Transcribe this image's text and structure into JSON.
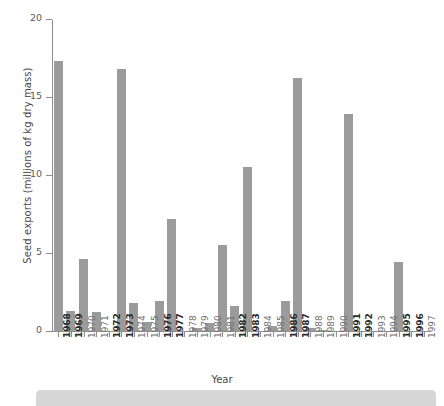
{
  "chart_data": {
    "type": "bar",
    "title": "",
    "xlabel": "Year",
    "ylabel": "Seed exports (millions of kg dry mass)",
    "ylim": [
      0,
      20
    ],
    "yticks": [
      0,
      5,
      10,
      15,
      20
    ],
    "ytick_labels": [
      "0",
      "5",
      "10",
      "15",
      "20"
    ],
    "grid": false,
    "legend": null,
    "bar_color": "#9b9b9b",
    "axis_color": "#8d8d8d",
    "categories": [
      "1968",
      "1969",
      "1970",
      "1971",
      "1972",
      "1973",
      "1974",
      "1975",
      "1976",
      "1977",
      "1978",
      "1979",
      "1980",
      "1981",
      "1982",
      "1983",
      "1984",
      "1985",
      "1986",
      "1987",
      "1988",
      "1989",
      "1990",
      "1991",
      "1992",
      "1993",
      "1994",
      "1995",
      "1996",
      "1997"
    ],
    "values": [
      17.3,
      1.3,
      4.6,
      1.2,
      0,
      16.8,
      1.8,
      0.6,
      1.9,
      7.2,
      0,
      0.2,
      0.5,
      5.5,
      1.6,
      10.5,
      0,
      0.35,
      1.9,
      16.2,
      0.2,
      0.05,
      0,
      13.9,
      0,
      0,
      0,
      4.4,
      0,
      0
    ],
    "emphasized_categories": [
      "1968",
      "1969",
      "1972",
      "1973",
      "1976",
      "1977",
      "1982",
      "1983",
      "1986",
      "1987",
      "1991",
      "1992",
      "1995",
      "1996"
    ]
  }
}
